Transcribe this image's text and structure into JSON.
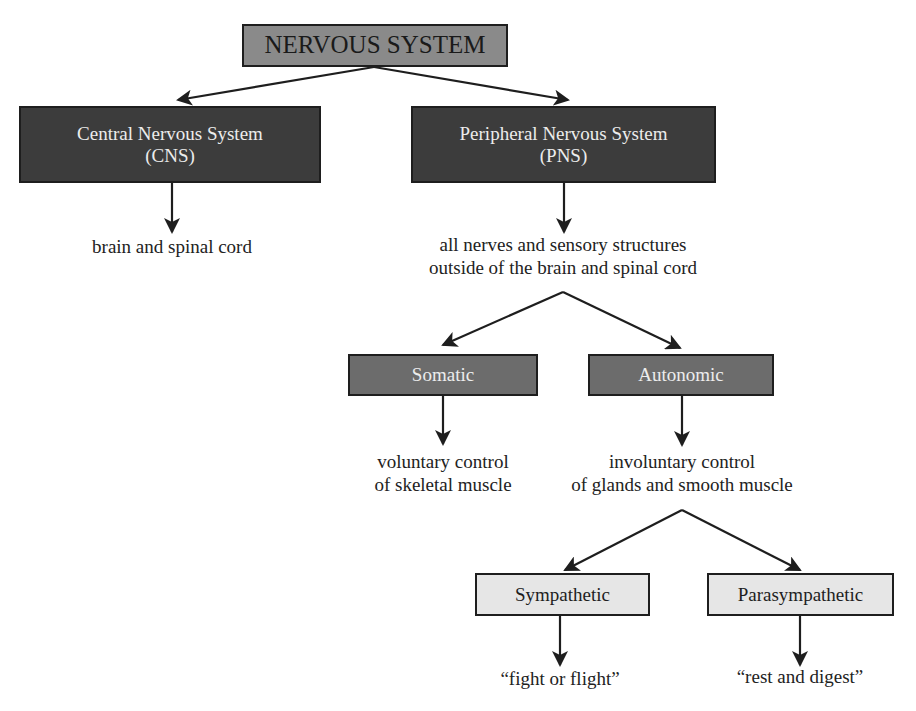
{
  "diagram": {
    "title": "NERVOUS SYSTEM",
    "colors": {
      "root_fill": "#8a8a8a",
      "level1_fill": "#3c3c3c",
      "level2_fill": "#6c6c6c",
      "level3_fill": "#e6e6e6",
      "line": "#1e1e1e"
    },
    "nodes": {
      "root": {
        "label": "NERVOUS SYSTEM"
      },
      "cns": {
        "line1": "Central Nervous System",
        "line2": "(CNS)",
        "description": "brain and spinal cord"
      },
      "pns": {
        "line1": "Peripheral Nervous System",
        "line2": "(PNS)",
        "description_line1": "all nerves and sensory structures",
        "description_line2": "outside of the brain and spinal cord"
      },
      "somatic": {
        "label": "Somatic",
        "description_line1": "voluntary control",
        "description_line2": "of skeletal muscle"
      },
      "autonomic": {
        "label": "Autonomic",
        "description_line1": "involuntary control",
        "description_line2": "of glands and smooth muscle"
      },
      "sympathetic": {
        "label": "Sympathetic",
        "description": "“fight or flight”"
      },
      "parasympathetic": {
        "label": "Parasympathetic",
        "description": "“rest and digest”"
      }
    },
    "edges": [
      {
        "from": "root",
        "to": "cns"
      },
      {
        "from": "root",
        "to": "pns"
      },
      {
        "from": "cns",
        "to": "cns-description"
      },
      {
        "from": "pns",
        "to": "pns-description"
      },
      {
        "from": "pns-description",
        "to": "somatic"
      },
      {
        "from": "pns-description",
        "to": "autonomic"
      },
      {
        "from": "somatic",
        "to": "somatic-description"
      },
      {
        "from": "autonomic",
        "to": "autonomic-description"
      },
      {
        "from": "autonomic-description",
        "to": "sympathetic"
      },
      {
        "from": "autonomic-description",
        "to": "parasympathetic"
      },
      {
        "from": "sympathetic",
        "to": "sympathetic-description"
      },
      {
        "from": "parasympathetic",
        "to": "parasympathetic-description"
      }
    ]
  }
}
